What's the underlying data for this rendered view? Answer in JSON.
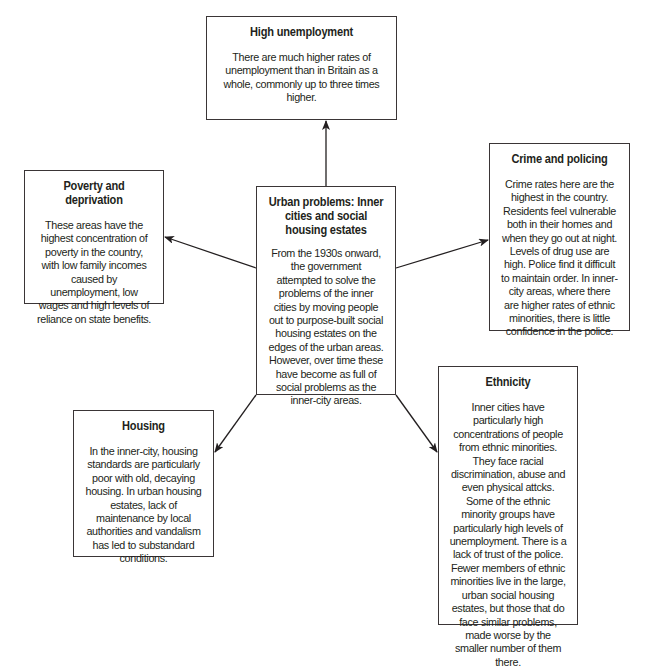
{
  "diagram": {
    "type": "spider-diagram",
    "center": {
      "title": "Urban problems: Inner cities and social housing estates",
      "body": "From the 1930s onward, the government attempted to solve the problems of the inner cities by moving people out to purpose-built social housing estates on the edges of the urban areas. However, over time these have become as full of social problems as the inner-city areas."
    },
    "nodes": [
      {
        "id": "unemployment",
        "title": "High unemployment",
        "body": "There are much higher rates of unemployment than in Britain as a whole, commonly up to three times higher."
      },
      {
        "id": "poverty",
        "title": "Poverty and deprivation",
        "body": "These areas have the highest concentration of poverty in the country, with low family incomes caused by unemployment, low wages and high levels of reliance on state benefits."
      },
      {
        "id": "crime",
        "title": "Crime and policing",
        "body": "Crime rates here are the highest in the country. Residents feel vulnerable both in their homes and when they go out at night. Levels of drug use are high. Police find it difficult to maintain order. In inner-city areas, where there are higher rates of ethnic minorities, there is little confidence in the police."
      },
      {
        "id": "housing",
        "title": "Housing",
        "body": "In the inner-city, housing standards are particularly poor with old, decaying housing. In urban housing estates, lack of maintenance by local authorities and vandalism has led to substandard conditions."
      },
      {
        "id": "ethnicity",
        "title": "Ethnicity",
        "body": "Inner cities have particularly high concentrations of people from ethnic minorities. They face racial discrimination, abuse and even physical attcks. Some of the ethnic minority groups have particularly high levels of unemployment. There is a lack of trust of the police. Fewer members of ethnic minorities live in the large, urban social housing estates, but those that do face similar problems, made worse by the smaller number of them there."
      }
    ],
    "edges": [
      {
        "from": "center",
        "to": "unemployment"
      },
      {
        "from": "center",
        "to": "poverty"
      },
      {
        "from": "center",
        "to": "crime"
      },
      {
        "from": "center",
        "to": "housing"
      },
      {
        "from": "center",
        "to": "ethnicity"
      }
    ],
    "colors": {
      "line": "#231f20",
      "border": "#3a3536",
      "background": "#ffffff",
      "text": "#231f20"
    }
  }
}
